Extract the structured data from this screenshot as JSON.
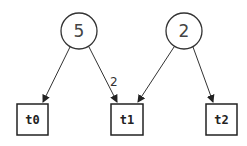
{
  "diagram": {
    "type": "petri-net",
    "places": [
      {
        "id": "p0",
        "tokens": "5",
        "cx": 79,
        "cy": 31,
        "r": 18
      },
      {
        "id": "p1",
        "tokens": "2",
        "cx": 184,
        "cy": 31,
        "r": 18
      }
    ],
    "transitions": [
      {
        "id": "t0",
        "label": "t0",
        "x": 17,
        "y": 104,
        "w": 31,
        "h": 31
      },
      {
        "id": "t1",
        "label": "t1",
        "x": 111,
        "y": 104,
        "w": 32,
        "h": 31
      },
      {
        "id": "t2",
        "label": "t2",
        "x": 206,
        "y": 104,
        "w": 31,
        "h": 31
      }
    ],
    "arcs": [
      {
        "from": "p0",
        "to": "t0",
        "weight": ""
      },
      {
        "from": "p0",
        "to": "t1",
        "weight": "2"
      },
      {
        "from": "p1",
        "to": "t1",
        "weight": ""
      },
      {
        "from": "p1",
        "to": "t2",
        "weight": ""
      }
    ],
    "colors": {
      "stroke": "#222222",
      "background": "#ffffff"
    }
  }
}
